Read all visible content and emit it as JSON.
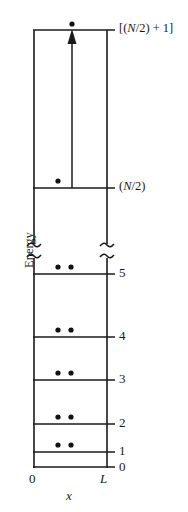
{
  "figure": {
    "type": "energy-level-diagram",
    "axis": {
      "y_label": "Energy",
      "x_label": "x",
      "x_tick_left": "0",
      "x_tick_right": "L",
      "x_left_value": 0,
      "x_right_value": "L",
      "has_axis_break": true,
      "break_symbol": "≈"
    },
    "box": {
      "left_px": 34,
      "right_px": 107,
      "top_px": 30,
      "bottom_px": 467
    },
    "levels": [
      {
        "label": "0",
        "y_px": 467,
        "electrons": 0,
        "kind": "floor"
      },
      {
        "label": "1",
        "y_px": 452,
        "electrons": 2,
        "kind": "filled"
      },
      {
        "label": "2",
        "y_px": 424,
        "electrons": 2,
        "kind": "filled"
      },
      {
        "label": "3",
        "y_px": 380,
        "electrons": 2,
        "kind": "filled"
      },
      {
        "label": "4",
        "y_px": 337,
        "electrons": 2,
        "kind": "filled"
      },
      {
        "label": "5",
        "y_px": 274,
        "electrons": 2,
        "kind": "filled"
      },
      {
        "label": "(N/2)",
        "y_px": 188,
        "electrons": 1,
        "kind": "highest-occupied"
      },
      {
        "label": "[(N/2) + 1]",
        "y_px": 30,
        "electrons": 1,
        "kind": "excited"
      }
    ],
    "excitation_arrow": {
      "from_level": "(N/2)",
      "to_level": "[(N/2) + 1]",
      "x_px": 72,
      "y_start_px": 188,
      "y_end_px": 30,
      "direction": "up"
    },
    "colors": {
      "line": "#1a1a1a",
      "electron": "#111111",
      "background": "#ffffff"
    }
  }
}
